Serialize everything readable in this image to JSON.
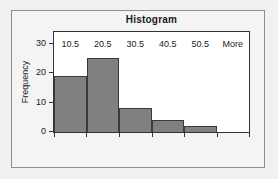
{
  "chart_data": {
    "type": "bar",
    "title": "Histogram",
    "xlabel": "",
    "ylabel": "Frequency",
    "categories": [
      "10.5",
      "20.5",
      "30.5",
      "40.5",
      "50.5",
      "More"
    ],
    "values": [
      19,
      25,
      8,
      4,
      2,
      0
    ],
    "ylim": [
      0,
      34
    ],
    "yticks": [
      0,
      10,
      20,
      30
    ],
    "ytick_labels": [
      "0",
      "10",
      "20",
      "30"
    ],
    "grid": false,
    "legend": false,
    "bar_color": "#808080",
    "bar_edge_color": "#3a3a3a",
    "plot_background": "#ffffff",
    "frame_color": "#333333",
    "page_background": "#f1f1f1"
  }
}
